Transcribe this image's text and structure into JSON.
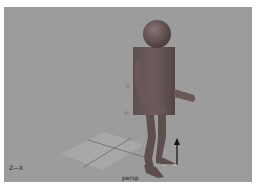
{
  "viewport": {
    "camera_name": "persp",
    "axis_indicator": "Z—X",
    "background_color": "#9c9c9c",
    "model_color": "#6a5a5a",
    "grid_color": "#a8a8a8",
    "manipulator_color": "#111111"
  },
  "scene": {
    "objects": [
      "head-sphere",
      "torso-cube",
      "left-arm",
      "right-arm",
      "left-leg",
      "right-leg",
      "ground-grid",
      "move-manipulator-y-arrow"
    ]
  }
}
